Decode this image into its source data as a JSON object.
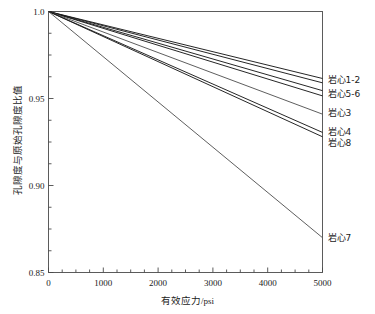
{
  "chart_data": {
    "type": "line",
    "title": "",
    "xlabel": "有效应力/psi",
    "ylabel": "孔隙度与原始孔隙度比值",
    "xlim": [
      0,
      5000
    ],
    "ylim": [
      0.85,
      1.0
    ],
    "grid": false,
    "legend_position": "right-inline-labels",
    "xticks": [
      0,
      1000,
      2000,
      3000,
      4000,
      5000
    ],
    "xtick_labels": [
      "0",
      "1000",
      "2000",
      "3000",
      "4000",
      "5000"
    ],
    "yticks": [
      0.85,
      0.9,
      0.95,
      1.0
    ],
    "ytick_labels": [
      "0.85",
      "0.90",
      "0.95",
      "1.0"
    ],
    "x": [
      0,
      5000
    ],
    "series": [
      {
        "name": "岩心1",
        "label": "岩心1-2",
        "values": [
          1.0,
          0.9615
        ],
        "color": "#1a1a1a"
      },
      {
        "name": "岩心2",
        "label": "岩心1-2",
        "values": [
          1.0,
          0.959
        ],
        "color": "#1a1a1a"
      },
      {
        "name": "岩心5",
        "label": "岩心5-6",
        "values": [
          1.0,
          0.9545
        ],
        "color": "#1a1a1a"
      },
      {
        "name": "岩心6",
        "label": "岩心5-6",
        "values": [
          1.0,
          0.9515
        ],
        "color": "#1a1a1a"
      },
      {
        "name": "岩心3",
        "label": "岩心3",
        "values": [
          1.0,
          0.941
        ],
        "color": "#555555"
      },
      {
        "name": "岩心4",
        "label": "岩心4",
        "values": [
          1.0,
          0.9305
        ],
        "color": "#1a1a1a"
      },
      {
        "name": "岩心8",
        "label": "岩心8",
        "values": [
          1.0,
          0.928
        ],
        "color": "#1a1a1a"
      },
      {
        "name": "岩心7",
        "label": "岩心7",
        "values": [
          1.0,
          0.87
        ],
        "color": "#555555"
      }
    ],
    "inline_labels": [
      {
        "text": "岩心1-2",
        "x": 5000,
        "y": 0.9605
      },
      {
        "text": "岩心5-6",
        "x": 5000,
        "y": 0.9525
      },
      {
        "text": "岩心3",
        "x": 5000,
        "y": 0.9415
      },
      {
        "text": "岩心4",
        "x": 5000,
        "y": 0.931
      },
      {
        "text": "岩心8",
        "x": 5000,
        "y": 0.9245
      },
      {
        "text": "岩心7",
        "x": 5000,
        "y": 0.87
      }
    ],
    "axis_color": "#4a4a4a"
  }
}
